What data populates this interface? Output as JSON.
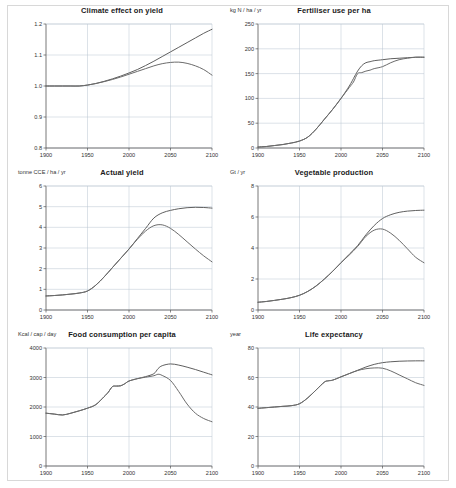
{
  "figure": {
    "background": "#ffffff",
    "frame_color": "#d8d8d8",
    "series_color_a": "#5f5f5f",
    "series_color_b": "#6b6b6b",
    "grid_color": "#b9c4d0"
  },
  "charts": [
    {
      "id": "climate-effect-on-yield",
      "type": "line",
      "title": "Climate effect on yield",
      "ylabel": "",
      "xlabel": "",
      "xlim": [
        1900,
        2100
      ],
      "ylim": [
        0.8,
        1.2
      ],
      "xticks": [
        "1900",
        "1950",
        "2000",
        "2050",
        "2100"
      ],
      "yticks": [
        "0.8",
        "0.9",
        "1.0",
        "1.1",
        "1.2"
      ],
      "grid": true,
      "x": [
        1900,
        1910,
        1920,
        1930,
        1940,
        1950,
        1960,
        1970,
        1980,
        1990,
        2000,
        2010,
        2020,
        2030,
        2040,
        2050,
        2060,
        2070,
        2080,
        2090,
        2100
      ],
      "series": [
        {
          "name": "scenario-1",
          "values": [
            1.0,
            1.0,
            1.0,
            1.0,
            1.0,
            1.003,
            1.008,
            1.015,
            1.023,
            1.032,
            1.042,
            1.053,
            1.066,
            1.08,
            1.095,
            1.11,
            1.125,
            1.14,
            1.155,
            1.17,
            1.183
          ]
        },
        {
          "name": "scenario-2",
          "values": [
            1.0,
            1.0,
            1.0,
            1.0,
            1.0,
            1.003,
            1.008,
            1.014,
            1.021,
            1.029,
            1.038,
            1.047,
            1.056,
            1.065,
            1.072,
            1.076,
            1.077,
            1.073,
            1.065,
            1.053,
            1.035
          ]
        }
      ]
    },
    {
      "id": "fertiliser-use-per-ha",
      "type": "line",
      "title": "Fertiliser use per ha",
      "ylabel": "kg N / ha / yr",
      "xlabel": "",
      "xlim": [
        1900,
        2100
      ],
      "ylim": [
        0,
        250
      ],
      "xticks": [
        "1900",
        "1950",
        "2000",
        "2050",
        "2100"
      ],
      "yticks": [
        "0",
        "50",
        "100",
        "150",
        "200",
        "250"
      ],
      "grid": true,
      "x": [
        1900,
        1910,
        1920,
        1930,
        1940,
        1950,
        1960,
        1970,
        1980,
        1990,
        2000,
        2010,
        2015,
        2020,
        2025,
        2030,
        2035,
        2040,
        2050,
        2060,
        2070,
        2080,
        2090,
        2100
      ],
      "series": [
        {
          "name": "scenario-1",
          "values": [
            2,
            3,
            5,
            7,
            10,
            14,
            22,
            38,
            58,
            78,
            100,
            125,
            140,
            155,
            166,
            172,
            174,
            176,
            178,
            180,
            181,
            182,
            183,
            183
          ]
        },
        {
          "name": "scenario-2",
          "values": [
            2,
            3,
            5,
            7,
            10,
            14,
            22,
            38,
            58,
            78,
            100,
            122,
            133,
            150,
            152,
            155,
            157,
            160,
            164,
            172,
            178,
            181,
            183,
            183
          ]
        }
      ]
    },
    {
      "id": "actual-yield",
      "type": "line",
      "title": "Actual yield",
      "ylabel": "tonne CCE / ha / yr",
      "xlabel": "",
      "xlim": [
        1900,
        2100
      ],
      "ylim": [
        0,
        6
      ],
      "xticks": [
        "1900",
        "1950",
        "2000",
        "2050",
        "2100"
      ],
      "yticks": [
        "0",
        "1",
        "2",
        "3",
        "4",
        "5",
        "6"
      ],
      "grid": true,
      "x": [
        1900,
        1910,
        1920,
        1930,
        1940,
        1950,
        1960,
        1970,
        1980,
        1990,
        2000,
        2010,
        2020,
        2030,
        2040,
        2050,
        2060,
        2070,
        2080,
        2090,
        2100
      ],
      "series": [
        {
          "name": "scenario-1",
          "values": [
            0.68,
            0.7,
            0.73,
            0.77,
            0.82,
            0.92,
            1.2,
            1.6,
            2.05,
            2.5,
            2.95,
            3.45,
            3.95,
            4.45,
            4.7,
            4.82,
            4.9,
            4.95,
            4.97,
            4.96,
            4.93
          ]
        },
        {
          "name": "scenario-2",
          "values": [
            0.68,
            0.7,
            0.73,
            0.77,
            0.82,
            0.92,
            1.2,
            1.6,
            2.05,
            2.5,
            2.95,
            3.42,
            3.82,
            4.08,
            4.12,
            3.95,
            3.65,
            3.3,
            2.95,
            2.62,
            2.33
          ]
        }
      ]
    },
    {
      "id": "vegetable-production",
      "type": "line",
      "title": "Vegetable production",
      "ylabel": "Gt / yr",
      "xlabel": "",
      "xlim": [
        1900,
        2100
      ],
      "ylim": [
        0,
        8
      ],
      "xticks": [
        "1900",
        "1950",
        "2000",
        "2050",
        "2100"
      ],
      "yticks": [
        "0",
        "2",
        "4",
        "6",
        "8"
      ],
      "grid": true,
      "x": [
        1900,
        1910,
        1920,
        1930,
        1940,
        1950,
        1960,
        1970,
        1980,
        1990,
        2000,
        2010,
        2020,
        2030,
        2040,
        2050,
        2060,
        2070,
        2080,
        2090,
        2100
      ],
      "series": [
        {
          "name": "scenario-1",
          "values": [
            0.5,
            0.55,
            0.62,
            0.7,
            0.8,
            0.95,
            1.2,
            1.55,
            2.0,
            2.5,
            3.05,
            3.6,
            4.15,
            4.85,
            5.45,
            5.9,
            6.15,
            6.3,
            6.38,
            6.42,
            6.44
          ]
        },
        {
          "name": "scenario-2",
          "values": [
            0.5,
            0.55,
            0.62,
            0.7,
            0.8,
            0.95,
            1.2,
            1.55,
            2.0,
            2.5,
            3.05,
            3.55,
            4.1,
            4.75,
            5.15,
            5.22,
            4.95,
            4.5,
            3.95,
            3.4,
            3.05
          ]
        }
      ]
    },
    {
      "id": "food-consumption-per-capita",
      "type": "line",
      "title": "Food consumption per capita",
      "ylabel": "Kcal / cap / day",
      "xlabel": "",
      "xlim": [
        1900,
        2100
      ],
      "ylim": [
        0,
        4000
      ],
      "xticks": [
        "1900",
        "1950",
        "2000",
        "2050",
        "2100"
      ],
      "yticks": [
        "0",
        "1000",
        "2000",
        "3000",
        "4000"
      ],
      "grid": true,
      "x": [
        1900,
        1910,
        1920,
        1930,
        1940,
        1950,
        1960,
        1970,
        1975,
        1980,
        1985,
        1990,
        1995,
        2000,
        2010,
        2020,
        2030,
        2035,
        2040,
        2050,
        2060,
        2070,
        2080,
        2090,
        2100
      ],
      "series": [
        {
          "name": "scenario-1",
          "values": [
            1790,
            1760,
            1730,
            1790,
            1870,
            1960,
            2080,
            2350,
            2500,
            2690,
            2710,
            2720,
            2790,
            2880,
            2960,
            3030,
            3130,
            3300,
            3400,
            3460,
            3420,
            3350,
            3270,
            3180,
            3090
          ]
        },
        {
          "name": "scenario-2",
          "values": [
            1790,
            1760,
            1730,
            1790,
            1870,
            1960,
            2080,
            2350,
            2500,
            2690,
            2710,
            2720,
            2790,
            2880,
            2960,
            3010,
            3060,
            3110,
            3070,
            2900,
            2520,
            2100,
            1790,
            1610,
            1500
          ]
        }
      ]
    },
    {
      "id": "life-expectancy",
      "type": "line",
      "title": "Life expectancy",
      "ylabel": "year",
      "xlabel": "",
      "xlim": [
        1900,
        2100
      ],
      "ylim": [
        0,
        90
      ],
      "xticks": [
        "1900",
        "1950",
        "2000",
        "2050",
        "2100"
      ],
      "yticks": [
        "0",
        "20",
        "40",
        "60",
        "80"
      ],
      "grid": true,
      "x": [
        1900,
        1910,
        1920,
        1930,
        1940,
        1950,
        1960,
        1970,
        1980,
        1985,
        1990,
        2000,
        2010,
        2020,
        2030,
        2040,
        2050,
        2060,
        2070,
        2080,
        2090,
        2100
      ],
      "series": [
        {
          "name": "scenario-1",
          "values": [
            44,
            44.5,
            45,
            45.5,
            46,
            47.5,
            52,
            58,
            64,
            65,
            65.5,
            68,
            70.5,
            73,
            75.5,
            77.5,
            78.8,
            79.5,
            79.9,
            80.1,
            80.2,
            80.2
          ]
        },
        {
          "name": "scenario-2",
          "values": [
            44,
            44.5,
            45,
            45.5,
            46,
            47.5,
            52,
            58,
            64,
            65,
            65.5,
            68,
            70.5,
            72.8,
            74.2,
            74.8,
            74.6,
            72.5,
            69.5,
            66.5,
            63.5,
            61.5
          ]
        }
      ]
    }
  ]
}
